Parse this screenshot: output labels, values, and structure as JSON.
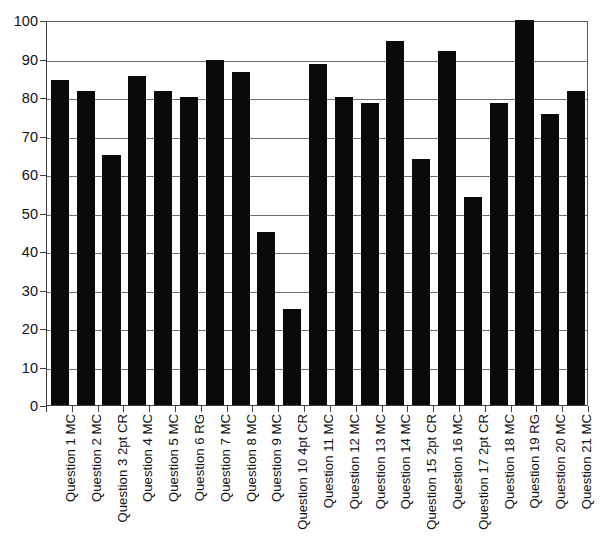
{
  "chart_data": {
    "type": "bar",
    "title": "",
    "subtitle": "",
    "xlabel": "",
    "ylabel": "",
    "ylim": [
      0,
      100
    ],
    "yticks": [
      0,
      10,
      20,
      30,
      40,
      50,
      60,
      70,
      80,
      90,
      100
    ],
    "grid": true,
    "legend": false,
    "legend_position": "none",
    "bar_color": "#0a0a0a",
    "categories": [
      "Question 1 MC",
      "Question 2 MC",
      "Question 3 2pt CR",
      "Question 4 MC",
      "Question 5 MC",
      "Question 6 RG",
      "Question 7 MC",
      "Question 8 MC",
      "Question 9 MC",
      "Question 10 4pt CR",
      "Question 11 MC",
      "Question 12 MC",
      "Question 13 MC",
      "Question 14 MC",
      "Question 15 2pt CR",
      "Question 16 MC",
      "Question 17 2pt CR",
      "Question 18 MC",
      "Question 19 RG",
      "Question 20 MC",
      "Question 21 MC"
    ],
    "values": [
      84.5,
      81.5,
      65,
      85.5,
      81.5,
      80,
      89.5,
      86.5,
      45,
      25,
      88.5,
      80,
      78.5,
      94.5,
      64,
      92,
      54,
      78.5,
      100,
      75.5,
      81.5
    ]
  }
}
